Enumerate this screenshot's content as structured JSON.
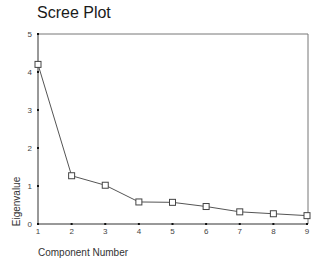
{
  "chart_data": {
    "type": "line",
    "title": "Scree Plot",
    "xlabel": "Component Number",
    "ylabel": "Eigenvalue",
    "categories": [
      "1",
      "2",
      "3",
      "4",
      "5",
      "6",
      "7",
      "8",
      "9"
    ],
    "x": [
      1,
      2,
      3,
      4,
      5,
      6,
      7,
      8,
      9
    ],
    "values": [
      4.2,
      1.27,
      1.02,
      0.58,
      0.57,
      0.46,
      0.32,
      0.27,
      0.22
    ],
    "ylim": [
      0,
      5
    ],
    "xlim": [
      1,
      9
    ],
    "yticks": [
      "0",
      "1",
      "2",
      "3",
      "4",
      "5"
    ],
    "grid": false,
    "legend": null,
    "marker": "open-square",
    "colors": {
      "line": "#555555",
      "axis": "#333333",
      "frame": "#777777"
    }
  }
}
